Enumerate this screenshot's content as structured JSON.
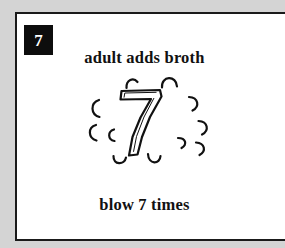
{
  "page": {
    "background_color": "#d4d4d4",
    "card_background_color": "#ffffff",
    "card_border_color": "#1a1a1a",
    "ink_color": "#111111"
  },
  "badge": {
    "label": "7",
    "background_color": "#0d0d0d",
    "text_color": "#ffffff"
  },
  "captions": {
    "top": "adult adds broth",
    "bottom": "blow 7 times"
  },
  "illustration": {
    "name": "steaming-number-seven",
    "center_numeral": "7",
    "steam_marks_count": 12,
    "steam_marks": [
      {
        "id": "arc-top-left",
        "cx": 55,
        "cy": 13,
        "r": 8,
        "start": 200,
        "end": 330,
        "tilt": -12
      },
      {
        "id": "arc-top-right",
        "cx": 93,
        "cy": 11,
        "r": 9,
        "start": 190,
        "end": 350,
        "tilt": 4
      },
      {
        "id": "arc-left-upper",
        "cx": 15,
        "cy": 38,
        "r": 8,
        "start": 105,
        "end": 255,
        "tilt": 0
      },
      {
        "id": "arc-right-upper",
        "cx": 118,
        "cy": 34,
        "r": 8,
        "start": 290,
        "end": 80,
        "tilt": 0
      },
      {
        "id": "arc-left-lower",
        "cx": 12,
        "cy": 62,
        "r": 8,
        "start": 105,
        "end": 250,
        "tilt": 0
      },
      {
        "id": "arc-left-inner",
        "cx": 32,
        "cy": 65,
        "r": 6,
        "start": 110,
        "end": 245,
        "tilt": 0
      },
      {
        "id": "arc-right-lower",
        "cx": 128,
        "cy": 58,
        "r": 8,
        "start": 295,
        "end": 80,
        "tilt": 0
      },
      {
        "id": "arc-right-inner",
        "cx": 107,
        "cy": 74,
        "r": 6,
        "start": 300,
        "end": 70,
        "tilt": 0
      },
      {
        "id": "arc-right-outer-low",
        "cx": 125,
        "cy": 79,
        "r": 7,
        "start": 300,
        "end": 65,
        "tilt": 0
      },
      {
        "id": "arc-bottom-left",
        "cx": 43,
        "cy": 92,
        "r": 7,
        "start": 15,
        "end": 165,
        "tilt": 0
      },
      {
        "id": "arc-bottom-right",
        "cx": 78,
        "cy": 92,
        "r": 8,
        "start": 10,
        "end": 160,
        "tilt": 0
      },
      {
        "id": "arc-bottom-far",
        "cx": 100,
        "cy": 95,
        "r": 6,
        "start": 15,
        "end": 150,
        "tilt": 0
      }
    ]
  }
}
